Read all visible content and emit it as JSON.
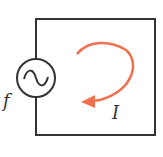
{
  "diagram": {
    "type": "AC circuit loop",
    "source_label": "f",
    "current_label": "I",
    "source_symbol": "ac-source-sine",
    "colors": {
      "wire": "#333333",
      "arrow": "#f07050",
      "background": "#ffffff"
    }
  }
}
